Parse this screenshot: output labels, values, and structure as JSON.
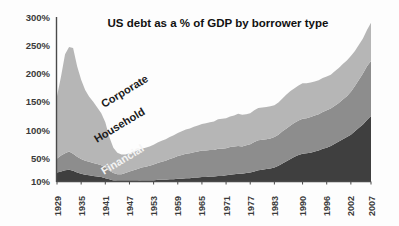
{
  "chart_data": {
    "type": "area",
    "stacked": true,
    "title": "US debt as a % of GDP by borrower type",
    "xlabel": "",
    "ylabel": "",
    "ylim": [
      10,
      300
    ],
    "grid": false,
    "legend_position": "inline-labels",
    "ytick_labels": [
      "300%",
      "250%",
      "200%",
      "150%",
      "100%",
      "50%",
      "10%"
    ],
    "ytick_values": [
      300,
      250,
      200,
      150,
      100,
      50,
      10
    ],
    "xtick_labels": [
      "1929",
      "1935",
      "1941",
      "1947",
      "1953",
      "1959",
      "1965",
      "1971",
      "1977",
      "1983",
      "1990",
      "1996",
      "2002",
      "2007"
    ],
    "xtick_values": [
      1929,
      1935,
      1941,
      1947,
      1953,
      1959,
      1965,
      1971,
      1977,
      1983,
      1990,
      1996,
      2002,
      2007
    ],
    "x": [
      1929,
      1930,
      1931,
      1932,
      1933,
      1934,
      1935,
      1936,
      1937,
      1938,
      1939,
      1940,
      1941,
      1942,
      1943,
      1944,
      1945,
      1946,
      1947,
      1948,
      1949,
      1950,
      1951,
      1952,
      1953,
      1954,
      1955,
      1956,
      1957,
      1958,
      1959,
      1960,
      1961,
      1962,
      1963,
      1964,
      1965,
      1966,
      1967,
      1968,
      1969,
      1970,
      1971,
      1972,
      1973,
      1974,
      1975,
      1976,
      1977,
      1978,
      1979,
      1980,
      1981,
      1982,
      1983,
      1984,
      1985,
      1986,
      1987,
      1988,
      1989,
      1990,
      1991,
      1992,
      1993,
      1994,
      1995,
      1996,
      1997,
      1998,
      1999,
      2000,
      2001,
      2002,
      2003,
      2004,
      2005,
      2006,
      2007
    ],
    "series": [
      {
        "name": "Financial",
        "color": "#3f3f3f",
        "label_color": "#f4f4f4",
        "values": [
          25,
          27,
          29,
          30,
          28,
          25,
          23,
          21,
          20,
          19,
          18,
          17,
          15,
          13,
          11,
          10,
          10,
          10,
          10,
          10,
          10,
          11,
          11,
          11,
          11,
          12,
          12,
          12,
          13,
          13,
          14,
          14,
          15,
          15,
          16,
          16,
          17,
          17,
          18,
          18,
          19,
          19,
          20,
          21,
          22,
          23,
          23,
          24,
          25,
          27,
          29,
          30,
          31,
          32,
          34,
          37,
          41,
          45,
          49,
          53,
          56,
          58,
          59,
          60,
          62,
          64,
          67,
          69,
          72,
          76,
          80,
          84,
          88,
          92,
          98,
          104,
          110,
          118,
          125
        ]
      },
      {
        "name": "Household",
        "color": "#8d8d8d",
        "label_color": "#1b1b1b",
        "values": [
          25,
          28,
          30,
          32,
          30,
          28,
          26,
          25,
          24,
          23,
          22,
          21,
          19,
          15,
          13,
          12,
          12,
          14,
          17,
          19,
          21,
          23,
          24,
          26,
          28,
          30,
          32,
          34,
          36,
          38,
          40,
          42,
          43,
          44,
          45,
          46,
          47,
          47,
          47,
          47,
          48,
          48,
          48,
          49,
          49,
          49,
          48,
          49,
          50,
          52,
          53,
          53,
          53,
          53,
          54,
          55,
          57,
          58,
          59,
          60,
          61,
          62,
          62,
          63,
          64,
          64,
          65,
          66,
          66,
          67,
          68,
          70,
          72,
          76,
          80,
          85,
          90,
          95,
          97
        ]
      },
      {
        "name": "Corporate",
        "color": "#b6b6b6",
        "label_color": "#1b1b1b",
        "values": [
          110,
          140,
          175,
          185,
          187,
          160,
          140,
          125,
          115,
          108,
          100,
          92,
          80,
          60,
          45,
          38,
          35,
          33,
          32,
          32,
          33,
          33,
          34,
          34,
          35,
          36,
          37,
          38,
          39,
          40,
          41,
          42,
          43,
          44,
          45,
          46,
          47,
          48,
          49,
          50,
          52,
          53,
          53,
          54,
          55,
          57,
          56,
          55,
          55,
          56,
          57,
          57,
          57,
          57,
          56,
          57,
          58,
          60,
          61,
          61,
          62,
          63,
          62,
          61,
          60,
          60,
          60,
          60,
          60,
          61,
          62,
          63,
          63,
          63,
          62,
          62,
          62,
          64,
          68
        ]
      }
    ],
    "series_labels": [
      {
        "name": "Corporate",
        "rotation": -31
      },
      {
        "name": "Household",
        "rotation": -31
      },
      {
        "name": "Financial",
        "rotation": -31
      }
    ]
  }
}
